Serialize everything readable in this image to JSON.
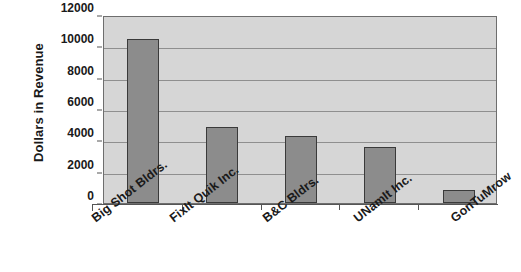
{
  "chart_data": {
    "type": "bar",
    "title": "",
    "xlabel": "",
    "ylabel": "Dollars in Revenue",
    "categories": [
      "Big Shot Bldrs.",
      "FixIt Quik Inc.",
      "B&C Bldrs.",
      "UNamIt Inc.",
      "GonTuMrow"
    ],
    "values": [
      10450,
      4850,
      4300,
      3550,
      800
    ],
    "ylim": [
      0,
      12000
    ],
    "ytick_labels": [
      "0",
      "2000",
      "4000",
      "6000",
      "8000",
      "10000",
      "12000"
    ],
    "ytick_values": [
      0,
      2000,
      4000,
      6000,
      8000,
      10000,
      12000
    ],
    "grid": true,
    "legend": false,
    "colors": {
      "bar_fill": "#8c8c8c",
      "bar_border": "#3a3a3a",
      "plot_background": "#d6d6d6",
      "gridline": "#8f8f8f",
      "axis": "#555555",
      "text": "#1a1a1a",
      "page_background": "#ffffff"
    }
  }
}
